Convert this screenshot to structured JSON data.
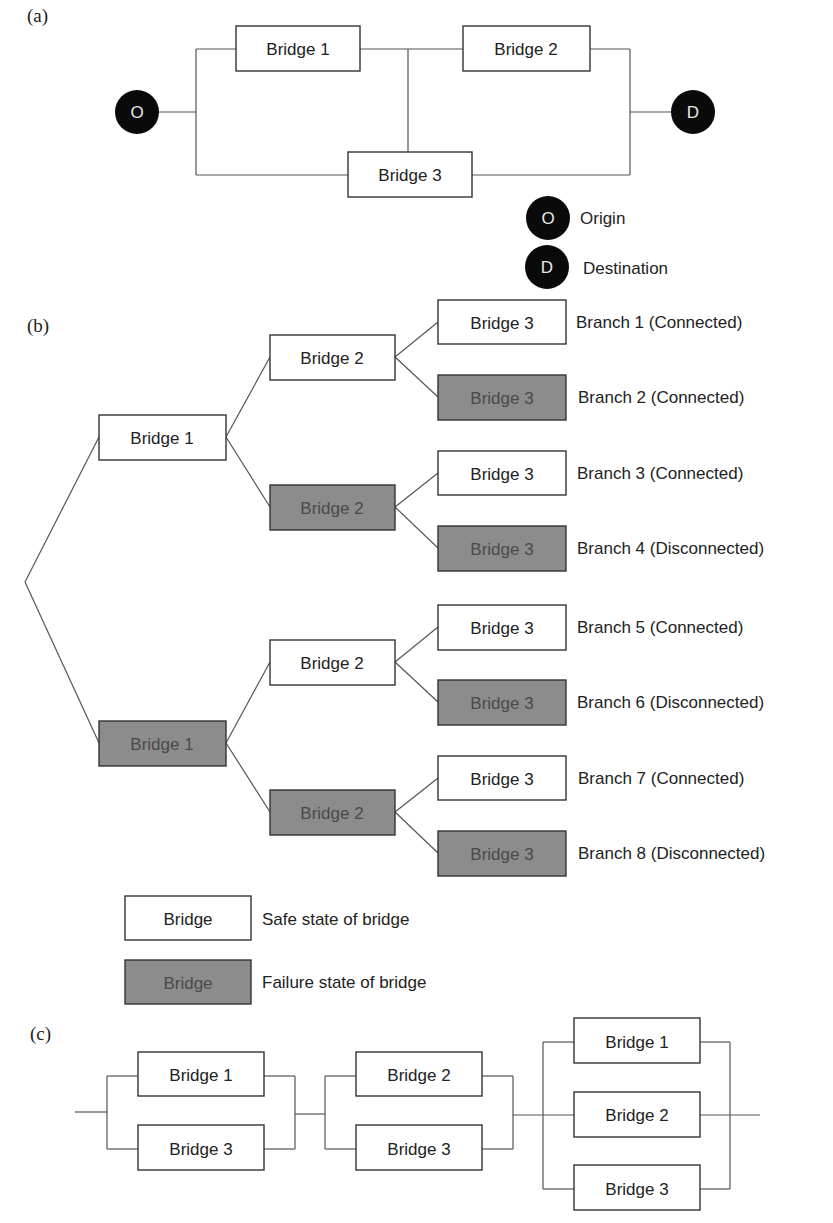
{
  "panels": {
    "a": {
      "label": "(a)",
      "origin_letter": "O",
      "destination_letter": "D",
      "bridges": [
        "Bridge 1",
        "Bridge 2",
        "Bridge 3"
      ],
      "legend": [
        {
          "letter": "O",
          "text": "Origin"
        },
        {
          "letter": "D",
          "text": "Destination"
        }
      ]
    },
    "b": {
      "label": "(b)",
      "level1": [
        {
          "label": "Bridge 1",
          "state": "safe"
        },
        {
          "label": "Bridge 1",
          "state": "fail"
        }
      ],
      "level2": [
        {
          "label": "Bridge 2",
          "state": "safe"
        },
        {
          "label": "Bridge 2",
          "state": "fail"
        },
        {
          "label": "Bridge 2",
          "state": "safe"
        },
        {
          "label": "Bridge 2",
          "state": "fail"
        }
      ],
      "level3": [
        {
          "label": "Bridge 3",
          "state": "safe"
        },
        {
          "label": "Bridge 3",
          "state": "fail"
        },
        {
          "label": "Bridge 3",
          "state": "safe"
        },
        {
          "label": "Bridge 3",
          "state": "fail"
        },
        {
          "label": "Bridge 3",
          "state": "safe"
        },
        {
          "label": "Bridge 3",
          "state": "fail"
        },
        {
          "label": "Bridge 3",
          "state": "safe"
        },
        {
          "label": "Bridge 3",
          "state": "fail"
        }
      ],
      "branches": [
        "Branch 1 (Connected)",
        "Branch 2 (Connected)",
        "Branch 3 (Connected)",
        "Branch 4 (Disconnected)",
        "Branch 5 (Connected)",
        "Branch 6 (Disconnected)",
        "Branch 7 (Connected)",
        "Branch 8 (Disconnected)"
      ],
      "legend": [
        {
          "box": "Bridge",
          "state": "safe",
          "text": "Safe state of bridge"
        },
        {
          "box": "Bridge",
          "state": "fail",
          "text": "Failure state of bridge"
        }
      ]
    },
    "c": {
      "label": "(c)",
      "groups": [
        [
          "Bridge 1",
          "Bridge 3"
        ],
        [
          "Bridge 2",
          "Bridge 3"
        ],
        [
          "Bridge 1",
          "Bridge 2",
          "Bridge 3"
        ]
      ]
    }
  },
  "colors": {
    "safe_fill": "#ffffff",
    "fail_fill": "#8c8c8c",
    "node_fill": "#0a0a0a",
    "line": "#555555"
  }
}
